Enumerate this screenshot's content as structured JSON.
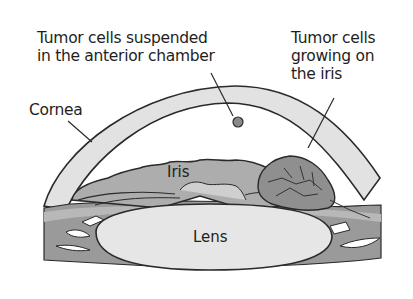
{
  "diagram": {
    "type": "anatomical-illustration",
    "labels": {
      "suspended": "Tumor cells suspended\nin the anterior chamber",
      "growing": "Tumor cells\ngrowing on\nthe iris",
      "cornea": "Cornea",
      "iris": "Iris",
      "lens": "Lens"
    },
    "colors": {
      "outline": "#2a2a2a",
      "cornea_fill": "#e2e2e2",
      "iris_fill": "#a9a9a9",
      "ciliary_fill": "#8c8c8c",
      "lens_fill": "#e6e6e6",
      "tumor_fill": "#8f8f8f",
      "cell_fill": "#8a8a8a"
    }
  }
}
